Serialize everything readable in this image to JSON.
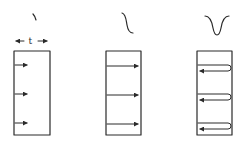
{
  "diagram": {
    "panels": [
      {
        "id": "panel-1",
        "pulse_shape": "short-tick",
        "thickness_label": "t",
        "arrows": [
          "right",
          "right",
          "right"
        ],
        "arrow_length": "short",
        "arrow_count": 3
      },
      {
        "id": "panel-2",
        "pulse_shape": "s-curve-step",
        "arrows": [
          "right",
          "right",
          "right"
        ],
        "arrow_length": "full-width",
        "arrow_count": 3
      },
      {
        "id": "panel-3",
        "pulse_shape": "v-dip",
        "arrows": [
          "right-then-reflect-left",
          "right-then-reflect-left",
          "right-then-reflect-left"
        ],
        "arrow_length": "round-trip",
        "arrow_count": 3
      }
    ],
    "colors": {
      "line": "#2a2a2a",
      "background": "#ffffff"
    }
  }
}
